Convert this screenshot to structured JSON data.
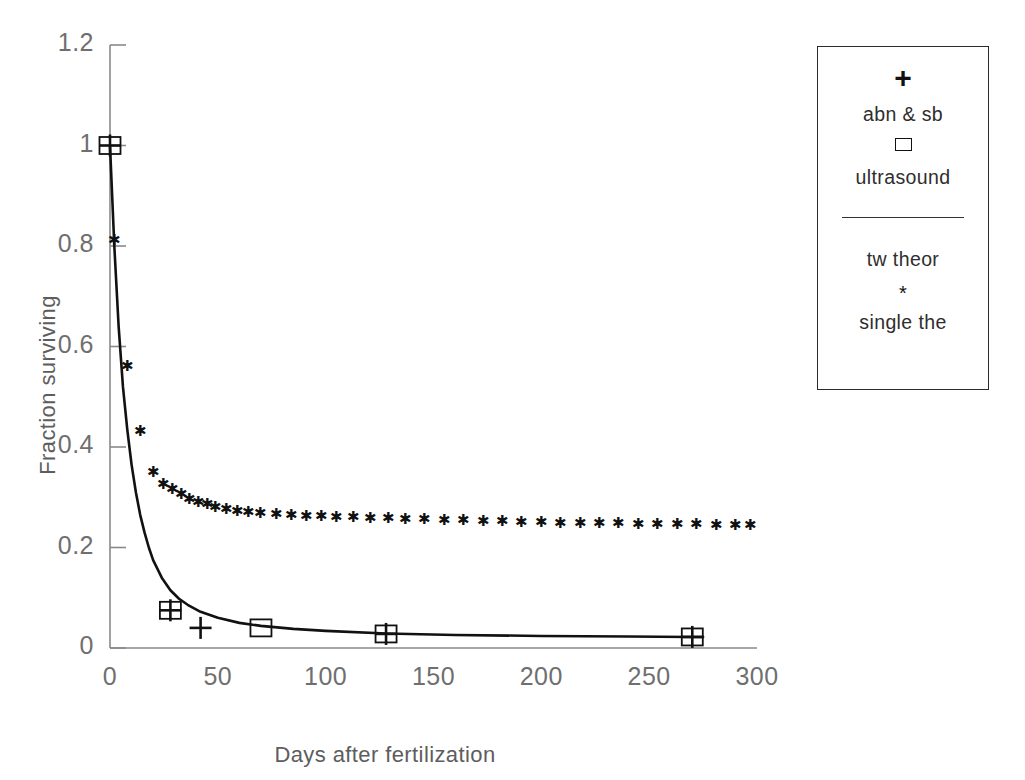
{
  "chart_data": {
    "type": "line",
    "title": "",
    "xlabel": "Days after fertilization",
    "ylabel": "Fraction surviving",
    "xlim": [
      0,
      300
    ],
    "ylim": [
      0,
      1.2
    ],
    "xticks": [
      "0",
      "50",
      "100",
      "150",
      "200",
      "250",
      "300"
    ],
    "xtick_values": [
      0,
      50,
      100,
      150,
      200,
      250,
      300
    ],
    "yticks": [
      "0",
      "0.2",
      "0.4",
      "0.6",
      "0.8",
      "1",
      "1.2"
    ],
    "ytick_values": [
      0,
      0.2,
      0.4,
      0.6,
      0.8,
      1,
      1.2
    ],
    "grid": false,
    "legend_position": "right-outside",
    "series": [
      {
        "name": "abn & sb",
        "marker": "plus",
        "style": "markers",
        "x": [
          0,
          28,
          42,
          128,
          270
        ],
        "y": [
          1.0,
          0.075,
          0.04,
          0.028,
          0.022
        ]
      },
      {
        "name": "ultrasound",
        "marker": "square",
        "style": "markers",
        "x": [
          0,
          28,
          70,
          128,
          270
        ],
        "y": [
          1.0,
          0.075,
          0.04,
          0.028,
          0.022
        ]
      },
      {
        "name": "tw theor",
        "marker": "none",
        "style": "line",
        "x": [
          0,
          2,
          4,
          6,
          8,
          10,
          12,
          14,
          16,
          18,
          20,
          24,
          28,
          32,
          36,
          42,
          50,
          60,
          70,
          85,
          100,
          128,
          160,
          200,
          240,
          270,
          275
        ],
        "y": [
          1.0,
          0.8,
          0.64,
          0.52,
          0.435,
          0.365,
          0.31,
          0.265,
          0.23,
          0.2,
          0.175,
          0.14,
          0.115,
          0.098,
          0.086,
          0.072,
          0.06,
          0.05,
          0.044,
          0.038,
          0.034,
          0.029,
          0.026,
          0.024,
          0.023,
          0.022,
          0.022
        ]
      },
      {
        "name": "single the",
        "marker": "star",
        "style": "markers",
        "x": [
          2,
          8,
          14,
          20,
          25,
          29,
          33,
          37,
          41,
          45,
          49,
          54,
          59,
          64,
          70,
          77,
          84,
          91,
          98,
          105,
          113,
          121,
          129,
          137,
          146,
          155,
          164,
          173,
          182,
          191,
          200,
          209,
          218,
          227,
          236,
          245,
          254,
          263,
          272,
          281,
          290,
          297
        ],
        "y": [
          0.81,
          0.56,
          0.43,
          0.35,
          0.325,
          0.315,
          0.305,
          0.295,
          0.29,
          0.285,
          0.28,
          0.275,
          0.272,
          0.27,
          0.268,
          0.266,
          0.264,
          0.262,
          0.261,
          0.26,
          0.259,
          0.258,
          0.257,
          0.256,
          0.255,
          0.254,
          0.253,
          0.252,
          0.251,
          0.25,
          0.249,
          0.248,
          0.248,
          0.247,
          0.247,
          0.246,
          0.246,
          0.245,
          0.245,
          0.244,
          0.244,
          0.244
        ]
      }
    ]
  },
  "legend": {
    "entries": [
      {
        "marker_glyph": "+",
        "marker_kind": "plus",
        "label": "abn & sb"
      },
      {
        "marker_glyph": "□",
        "marker_kind": "square",
        "label": "ultrasound"
      },
      {
        "marker_glyph": "—",
        "marker_kind": "line",
        "label": "tw theor"
      },
      {
        "marker_glyph": "*",
        "marker_kind": "star",
        "label": "single the"
      }
    ]
  },
  "colors": {
    "curve": "#111111",
    "marker": "#111111",
    "axis": "#8a8a8a",
    "tick_text": "#6f6f6f",
    "axis_title": "#5d5d5d",
    "legend_border": "#2b2b2b",
    "background": "#ffffff"
  }
}
